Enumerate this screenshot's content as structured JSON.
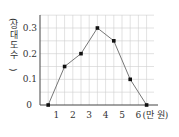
{
  "chart_data": {
    "type": "line",
    "title": "",
    "xlabel": "(만 원)",
    "ylabel": "(상대도수)",
    "x": [
      0.5,
      1.5,
      2.5,
      3.5,
      4.5,
      5.5,
      6.5
    ],
    "series": [
      {
        "name": "상대도수",
        "values": [
          0,
          0.15,
          0.2,
          0.3,
          0.25,
          0.1,
          0
        ]
      }
    ],
    "x_ticks": [
      "1",
      "2",
      "3",
      "4",
      "5",
      "6"
    ],
    "x_tick_values": [
      1,
      2,
      3,
      4,
      5,
      6
    ],
    "y_ticks": [
      "0",
      "0.1",
      "0.2",
      "0.3"
    ],
    "y_tick_values": [
      0,
      0.1,
      0.2,
      0.3
    ],
    "origin_label": "0",
    "xlim": [
      0,
      7
    ],
    "ylim": [
      0,
      0.35
    ],
    "grid": true,
    "grid_x_step": 0.5,
    "grid_y_step": 0.05,
    "legend": "none"
  },
  "colors": {
    "line": "#777777",
    "marker": "#111111",
    "grid": "#cfcfcf",
    "axis": "#444444"
  }
}
